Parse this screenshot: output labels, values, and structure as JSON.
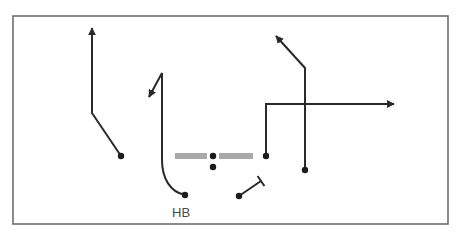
{
  "diagram": {
    "type": "football-play",
    "colors": {
      "frame": "#6e6e6e",
      "route": "#2a2a2a",
      "player": "#1c1c1c",
      "line_of_scrimmage": "#a9a9a9",
      "label": "#4a4a4a",
      "background": "#ffffff"
    },
    "labels": {
      "halfback": "HB"
    },
    "line_of_scrimmage": {
      "y": 156,
      "segments": [
        [
          175,
          207
        ],
        [
          219,
          253
        ]
      ]
    },
    "players": [
      {
        "id": "center",
        "x": 213,
        "y": 156
      },
      {
        "id": "quarterback",
        "x": 213,
        "y": 167
      },
      {
        "id": "left-receiver",
        "x": 121,
        "y": 156
      },
      {
        "id": "halfback",
        "x": 185,
        "y": 195
      },
      {
        "id": "blocker",
        "x": 239,
        "y": 196
      },
      {
        "id": "slot-receiver",
        "x": 266,
        "y": 156
      },
      {
        "id": "right-receiver",
        "x": 305,
        "y": 170
      }
    ],
    "routes": [
      {
        "player": "left-receiver",
        "type": "arrow",
        "path": "M121,156 L92,113 L92,28"
      },
      {
        "player": "halfback",
        "type": "arrow",
        "path": "M185,195 C170,192 162,178 162,160 L162,73 L149,97"
      },
      {
        "player": "slot-receiver",
        "type": "arrow",
        "path": "M266,156 L266,104 L394,104"
      },
      {
        "player": "right-receiver",
        "type": "arrow",
        "path": "M305,170 L305,68 L276,36"
      },
      {
        "player": "blocker",
        "type": "block",
        "path": "M239,196 L261,181"
      }
    ]
  }
}
